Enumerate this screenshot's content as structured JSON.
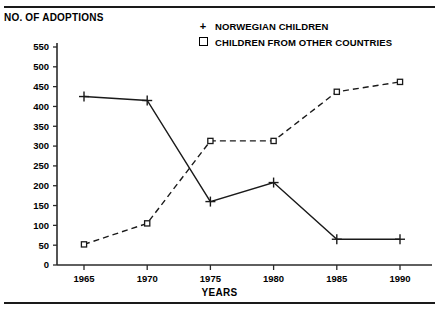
{
  "chart_data": {
    "type": "line",
    "title": "",
    "xlabel": "YEARS",
    "ylabel": "NO. OF ADOPTIONS",
    "categories": [
      1965,
      1970,
      1975,
      1980,
      1985,
      1990
    ],
    "xtick_labels": [
      "1965",
      "1970",
      "1975",
      "1980",
      "1985",
      "1990"
    ],
    "ytick_labels": [
      "550",
      "500",
      "450",
      "400",
      "350",
      "300",
      "250",
      "200",
      "150",
      "100",
      "50",
      "0"
    ],
    "ytick_values": [
      550,
      500,
      450,
      400,
      350,
      300,
      250,
      200,
      150,
      100,
      50,
      0
    ],
    "ylim": [
      0,
      550
    ],
    "xlim": [
      1963,
      1992
    ],
    "grid": false,
    "legend_position": "top-right",
    "series": [
      {
        "name": "NORWEGIAN CHILDREN",
        "marker": "plus",
        "line_style": "solid",
        "color": "#1a1a1a",
        "values": [
          425,
          415,
          160,
          208,
          65,
          65
        ]
      },
      {
        "name": "CHILDREN FROM OTHER COUNTRIES",
        "marker": "square",
        "line_style": "dashed",
        "color": "#1a1a1a",
        "values": [
          52,
          105,
          313,
          313,
          437,
          462
        ]
      }
    ]
  },
  "axis_titles": {
    "y": "NO. OF ADOPTIONS",
    "x": "YEARS"
  },
  "legend": {
    "items": [
      {
        "marker": "+",
        "label": "NORWEGIAN CHILDREN"
      },
      {
        "marker": "square",
        "label": "CHILDREN FROM OTHER COUNTRIES"
      }
    ]
  }
}
